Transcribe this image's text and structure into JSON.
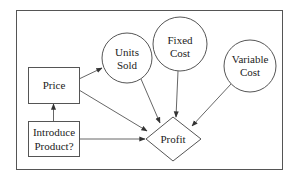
{
  "diagram": {
    "type": "influence-diagram",
    "colors": {
      "stroke": "#555555",
      "text": "#222222",
      "background": "#ffffff"
    },
    "nodes": {
      "price": {
        "shape": "rectangle",
        "kind": "decision",
        "lines": [
          "Price"
        ]
      },
      "introduce": {
        "shape": "rectangle",
        "kind": "decision",
        "lines": [
          "Introduce",
          "Product?"
        ]
      },
      "units_sold": {
        "shape": "circle",
        "kind": "chance",
        "lines": [
          "Units",
          "Sold"
        ]
      },
      "fixed_cost": {
        "shape": "circle",
        "kind": "chance",
        "lines": [
          "Fixed",
          "Cost"
        ]
      },
      "variable_cost": {
        "shape": "circle",
        "kind": "chance",
        "lines": [
          "Variable",
          "Cost"
        ]
      },
      "profit": {
        "shape": "diamond",
        "kind": "value",
        "lines": [
          "Profit"
        ]
      }
    },
    "edges": [
      {
        "from": "Introduce Product?",
        "to": "Price"
      },
      {
        "from": "Price",
        "to": "Units Sold"
      },
      {
        "from": "Price",
        "to": "Profit"
      },
      {
        "from": "Introduce Product?",
        "to": "Profit"
      },
      {
        "from": "Units Sold",
        "to": "Profit"
      },
      {
        "from": "Fixed Cost",
        "to": "Profit"
      },
      {
        "from": "Variable Cost",
        "to": "Profit"
      }
    ]
  }
}
